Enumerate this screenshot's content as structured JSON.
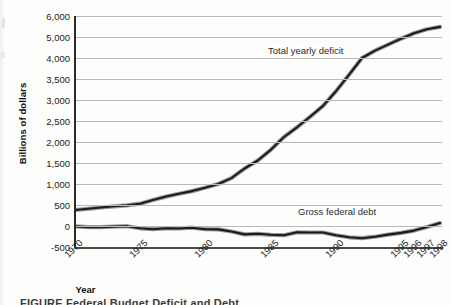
{
  "figure": {
    "caption_fragment": "FIGURE   Federal Budget Deficit and Debt"
  },
  "chart_data": {
    "type": "line",
    "title": "",
    "xlabel": "Year",
    "ylabel": "Billions of dollars",
    "grid": true,
    "legend_position": "inline-annotation",
    "x": [
      1970,
      1971,
      1972,
      1973,
      1974,
      1975,
      1976,
      1977,
      1978,
      1979,
      1980,
      1981,
      1982,
      1983,
      1984,
      1985,
      1986,
      1987,
      1988,
      1989,
      1990,
      1991,
      1992,
      1993,
      1994,
      1995,
      1996,
      1997,
      1998
    ],
    "xtick_labels": [
      "1970",
      "1975",
      "1980",
      "1985",
      "1990",
      "1995",
      "1996",
      "1997",
      "1998"
    ],
    "ytick_labels": [
      "6,000",
      "5,000",
      "4,000",
      "3,500",
      "3,000",
      "2,500",
      "2,000",
      "1,500",
      "1,000",
      "500",
      "0",
      "-500"
    ],
    "ytick_values": [
      6000,
      5000,
      4000,
      3500,
      3000,
      2500,
      2000,
      1500,
      1000,
      500,
      0,
      -500
    ],
    "ylim": [
      -500,
      6000
    ],
    "series": [
      {
        "name": "Total yearly deficit",
        "values": [
          380,
          410,
          440,
          470,
          490,
          530,
          620,
          700,
          770,
          830,
          910,
          1000,
          1140,
          1370,
          1560,
          1820,
          2120,
          2350,
          2600,
          2860,
          3210,
          3600,
          4000,
          4350,
          4640,
          4920,
          5180,
          5370,
          5480
        ]
      },
      {
        "name": "Gross federal debt",
        "values": [
          -10,
          -25,
          -25,
          -15,
          -5,
          -55,
          -75,
          -55,
          -60,
          -40,
          -75,
          -80,
          -130,
          -200,
          -185,
          -210,
          -220,
          -150,
          -155,
          -155,
          -220,
          -270,
          -290,
          -255,
          -205,
          -165,
          -110,
          -22,
          70
        ]
      }
    ],
    "annotations": [
      {
        "text": "Total yearly deficit",
        "series": "Total yearly deficit"
      },
      {
        "text": "Gross federal debt",
        "series": "Gross federal debt"
      }
    ]
  }
}
